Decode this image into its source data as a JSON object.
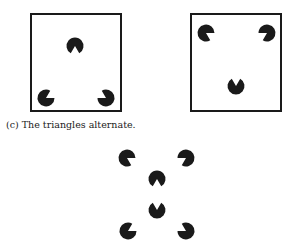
{
  "top_clipped_text": "",
  "caption": "(c) The triangles alternate.",
  "figure": {
    "left_panel": {
      "description": "Kanizsa upward-pointing illusory triangle inside square frame",
      "inducers": [
        {
          "position": "top-center",
          "mouth": "down"
        },
        {
          "position": "bottom-left",
          "mouth": "up-right"
        },
        {
          "position": "bottom-right",
          "mouth": "up-left"
        }
      ]
    },
    "right_panel": {
      "description": "Kanizsa downward-pointing illusory triangle inside square frame",
      "inducers": [
        {
          "position": "top-left",
          "mouth": "down-right"
        },
        {
          "position": "top-right",
          "mouth": "down-left"
        },
        {
          "position": "bottom-center",
          "mouth": "up"
        }
      ]
    },
    "bottom_panel": {
      "description": "Alternating illusory triangles without frame",
      "inducer_count": 6
    }
  },
  "colors": {
    "ink": "#1a1a1a",
    "background": "#ffffff"
  }
}
